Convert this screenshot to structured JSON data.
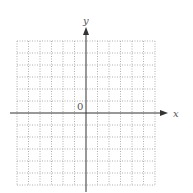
{
  "chart_data": {
    "type": "line",
    "title": "",
    "xlabel": "x",
    "ylabel": "y",
    "origin_label": "0",
    "xlim": [
      -6,
      6
    ],
    "ylim": [
      -6,
      6
    ],
    "grid": true,
    "grid_style": "dotted",
    "grid_step": 1,
    "series": [],
    "tick_labels_shown": false,
    "legend": null
  },
  "colors": {
    "axis": "#333333",
    "grid": "#b0b0b0",
    "label": "#555555",
    "background": "#ffffff"
  }
}
